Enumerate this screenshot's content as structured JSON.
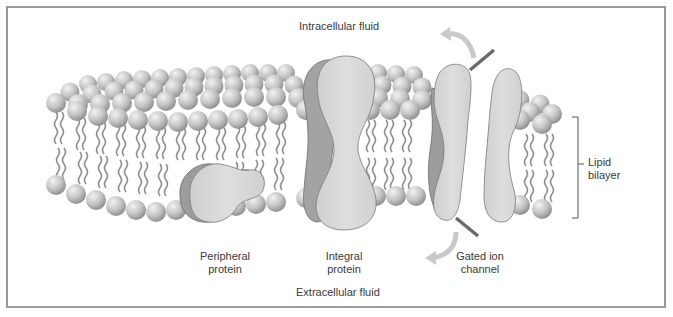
{
  "diagram": {
    "labels": {
      "intracellular": "Intracellular fluid",
      "extracellular": "Extracellular fluid",
      "peripheral_line1": "Peripheral",
      "peripheral_line2": "protein",
      "integral_line1": "Integral",
      "integral_line2": "protein",
      "gated_line1": "Gated ion",
      "gated_line2": "channel",
      "lipid_line1": "Lipid",
      "lipid_line2": "bilayer"
    },
    "colors": {
      "frame": "#9a9a9a",
      "head": "#c4c4c4",
      "protein": "#d6d6d6",
      "protein_shadow": "#9c9c9c",
      "tail": "#8f8f8f",
      "gate_bar": "#6a6a6a",
      "arrow": "#c9c9c9",
      "text": "#3a3a3a"
    }
  }
}
